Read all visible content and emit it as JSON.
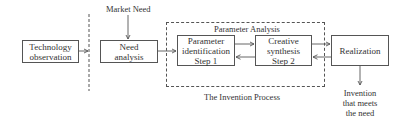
{
  "diagram": {
    "title": "The Invention Process",
    "region_label": "Parameter Analysis",
    "input_label": "Market Need",
    "output_label": "Invention that meets the need",
    "output_lines": [
      "Invention",
      "that meets",
      "the need"
    ],
    "boxes": [
      {
        "id": "technology-observation",
        "lines": [
          "Technology",
          "observation"
        ]
      },
      {
        "id": "need-analysis",
        "lines": [
          "Need",
          "analysis"
        ]
      },
      {
        "id": "parameter-identification",
        "lines": [
          "Parameter",
          "identification",
          "Step 1"
        ]
      },
      {
        "id": "creative-synthesis",
        "lines": [
          "Creative",
          "synthesis",
          "Step 2"
        ]
      },
      {
        "id": "realization",
        "lines": [
          "Realization"
        ]
      }
    ],
    "edges": [
      {
        "from": "technology-observation",
        "to": "dashed-divider"
      },
      {
        "from": "market-need",
        "to": "need-analysis"
      },
      {
        "from": "need-analysis",
        "to": "parameter-analysis-region"
      },
      {
        "from": "parameter-identification",
        "to": "creative-synthesis"
      },
      {
        "from": "creative-synthesis",
        "to": "parameter-identification"
      },
      {
        "from": "creative-synthesis",
        "to": "realization"
      },
      {
        "from": "realization",
        "to": "creative-synthesis"
      },
      {
        "from": "realization",
        "to": "invention-output"
      }
    ],
    "colors": {
      "line": "#555555",
      "text": "#333333",
      "background": "#ffffff"
    }
  }
}
